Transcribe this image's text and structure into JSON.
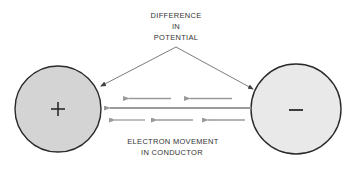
{
  "title_label": {
    "lines": [
      "DIFFERENCE",
      "IN",
      "POTENTIAL"
    ]
  },
  "bottom_label": {
    "lines": [
      "ELECTRON MOVEMENT",
      "IN CONDUCTOR"
    ]
  },
  "positive_terminal": {
    "symbol": "+",
    "fill": "#d4d4d4"
  },
  "negative_terminal": {
    "symbol": "−",
    "fill": "#e9e9e9"
  },
  "colors": {
    "outline": "#2a2a2a",
    "electron_arrow": "#9a9a9a",
    "pointer_line": "#444444",
    "text": "#333333"
  }
}
